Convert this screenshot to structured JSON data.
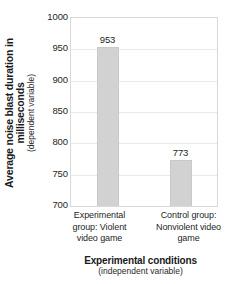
{
  "chart_data": {
    "type": "bar",
    "title": "",
    "categories": [
      "Experimental group: Violent video game",
      "Control group: Nonviolent video game"
    ],
    "values": [
      953,
      773
    ],
    "value_labels": [
      "953",
      "773"
    ],
    "xlabel": "Experimental conditions",
    "xlabel_sub": "(independent variable)",
    "ylabel": "Average noise blast duration in milliseconds",
    "ylabel_sub": "(dependent variable)",
    "ylim": [
      700,
      1000
    ],
    "yticks": [
      700,
      750,
      800,
      850,
      900,
      950,
      1000
    ],
    "ytick_labels": [
      "700",
      "750",
      "800",
      "850",
      "900",
      "950",
      "1000"
    ],
    "grid": true,
    "legend": "none",
    "bar_color": "#d2d2d2",
    "gridline_color": "#e9e9e9",
    "axis_border_color": "#d8d8d8",
    "text_color": "#1a1a1a",
    "background_color": "#ffffff"
  },
  "axis": {
    "y_title_main": "Average noise blast duration in milliseconds",
    "y_title_sub": "(dependent variable)",
    "x_title_main": "Experimental conditions",
    "x_title_sub": "(independent variable)"
  },
  "categories_multiline": [
    [
      "Experimental",
      "group: Violent",
      "video game"
    ],
    [
      "Control group:",
      "Nonviolent video",
      "game"
    ]
  ]
}
